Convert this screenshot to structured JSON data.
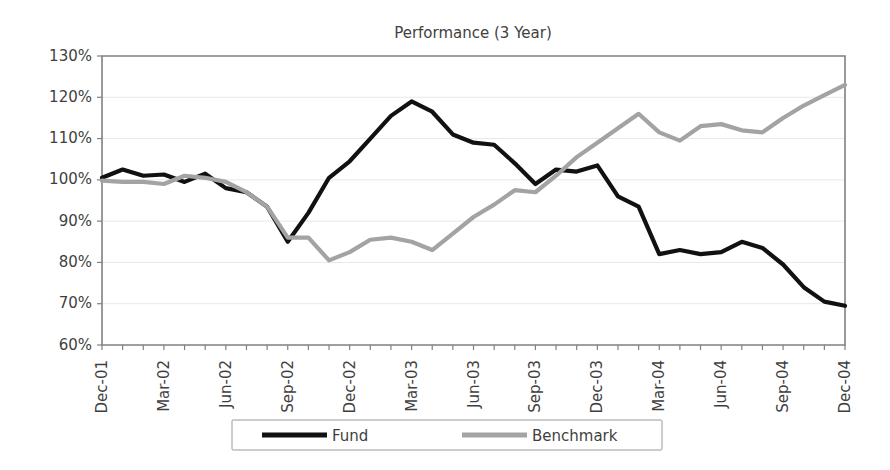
{
  "chart_data": {
    "type": "line",
    "title": "Performance (3 Year)",
    "xlabel": "",
    "ylabel": "",
    "ylim": [
      60,
      130
    ],
    "ytick_values": [
      60,
      70,
      80,
      90,
      100,
      110,
      120,
      130
    ],
    "ytick_labels": [
      "60%",
      "70%",
      "80%",
      "90%",
      "100%",
      "110%",
      "120%",
      "130%"
    ],
    "grid": true,
    "legend_position": "bottom",
    "x": [
      "Dec-01",
      "Jan-02",
      "Feb-02",
      "Mar-02",
      "Apr-02",
      "May-02",
      "Jun-02",
      "Jul-02",
      "Aug-02",
      "Sep-02",
      "Oct-02",
      "Nov-02",
      "Dec-02",
      "Jan-03",
      "Feb-03",
      "Mar-03",
      "Apr-03",
      "May-03",
      "Jun-03",
      "Jul-03",
      "Aug-03",
      "Sep-03",
      "Oct-03",
      "Nov-03",
      "Dec-03",
      "Jan-04",
      "Feb-04",
      "Mar-04",
      "Apr-04",
      "May-04",
      "Jun-04",
      "Jul-04",
      "Aug-04",
      "Sep-04",
      "Oct-04",
      "Nov-04",
      "Dec-04"
    ],
    "xtick_labels": [
      "Dec-01",
      "Mar-02",
      "Jun-02",
      "Sep-02",
      "Dec-02",
      "Mar-03",
      "Jun-03",
      "Sep-03",
      "Dec-03",
      "Mar-04",
      "Jun-04",
      "Sep-04",
      "Dec-04"
    ],
    "xtick_label_every": 3,
    "series": [
      {
        "name": "Fund",
        "color": "#111111",
        "width": 4.2,
        "values": [
          100.5,
          102.5,
          101.0,
          101.3,
          99.5,
          101.5,
          98.0,
          97.0,
          93.5,
          85.0,
          92.0,
          100.5,
          104.5,
          110.0,
          115.5,
          119.0,
          116.5,
          111.0,
          109.0,
          108.5,
          104.0,
          99.0,
          102.5,
          102.0,
          103.5,
          96.0,
          93.5,
          82.0,
          83.0,
          82.0,
          82.5,
          85.0,
          83.5,
          79.5,
          74.0,
          70.5,
          69.5
        ]
      },
      {
        "name": "Benchmark",
        "color": "#a3a3a3",
        "width": 4.2,
        "values": [
          99.8,
          99.5,
          99.5,
          99.0,
          101.0,
          100.5,
          99.5,
          97.0,
          93.5,
          86.0,
          86.0,
          80.5,
          82.5,
          85.5,
          86.0,
          85.0,
          83.0,
          87.0,
          91.0,
          94.0,
          97.5,
          97.0,
          101.0,
          105.5,
          109.0,
          112.5,
          116.0,
          111.5,
          109.5,
          113.0,
          113.5,
          112.0,
          111.5,
          115.0,
          118.0,
          120.5,
          123.0
        ]
      }
    ]
  },
  "legend": {
    "entries": [
      {
        "label": "Fund",
        "color": "#111111"
      },
      {
        "label": "Benchmark",
        "color": "#a3a3a3"
      }
    ]
  },
  "plot_geometry": {
    "left": 102,
    "right": 845,
    "top": 56,
    "bottom": 345
  }
}
